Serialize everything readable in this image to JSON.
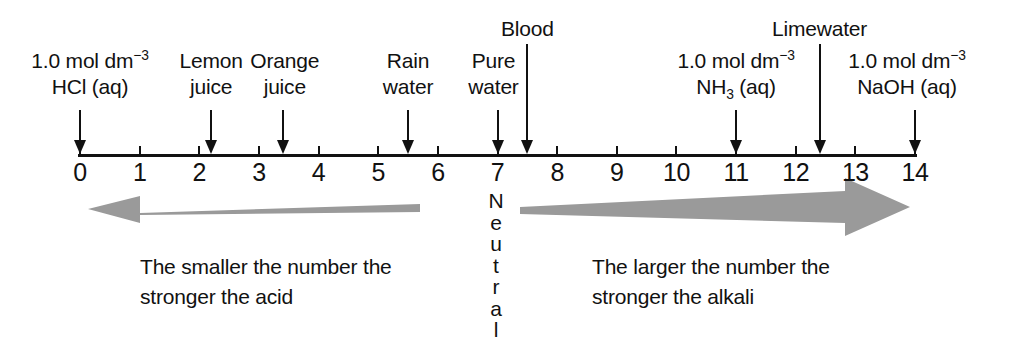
{
  "figure": {
    "type": "ph-scale-diagram",
    "background": "#ffffff",
    "ink_color": "#111111",
    "arrow_gray": "#9a9a9a"
  },
  "axis": {
    "min": 0,
    "max": 14,
    "ticks": [
      "0",
      "1",
      "2",
      "3",
      "4",
      "5",
      "6",
      "7",
      "8",
      "9",
      "10",
      "11",
      "12",
      "13",
      "14"
    ],
    "tick_values": [
      0,
      1,
      2,
      3,
      4,
      5,
      6,
      7,
      8,
      9,
      10,
      11,
      12,
      13,
      14
    ]
  },
  "neutral_marker": {
    "word": "Neutral",
    "ph": 7,
    "letters": [
      "N",
      "e",
      "u",
      "t",
      "r",
      "a",
      "l"
    ]
  },
  "substances": [
    {
      "id": "hcl",
      "ph": 0.0,
      "line1_html": "1.0 mol dm<sup>−3</sup>",
      "line2_html": "HCl (aq)",
      "lines": 2,
      "plain": "1.0 mol dm-3 HCl (aq)"
    },
    {
      "id": "lemon-juice",
      "ph": 2.2,
      "line1_html": "Lemon",
      "line2_html": "juice",
      "lines": 2,
      "plain": "Lemon juice"
    },
    {
      "id": "orange-juice",
      "ph": 3.4,
      "line1_html": "Orange",
      "line2_html": "juice",
      "lines": 2,
      "plain": "Orange juice"
    },
    {
      "id": "rain-water",
      "ph": 5.5,
      "line1_html": "Rain",
      "line2_html": "water",
      "lines": 2,
      "plain": "Rain water"
    },
    {
      "id": "pure-water",
      "ph": 7.0,
      "line1_html": "Pure",
      "line2_html": "water",
      "lines": 2,
      "plain": "Pure water"
    },
    {
      "id": "blood",
      "ph": 7.5,
      "line1_html": "Blood",
      "line2_html": "",
      "lines": 1,
      "plain": "Blood"
    },
    {
      "id": "ammonia",
      "ph": 11.0,
      "line1_html": "1.0 mol dm<sup>−3</sup>",
      "line2_html": "NH<sub>3</sub> (aq)",
      "lines": 2,
      "plain": "1.0 mol dm-3 NH3 (aq)"
    },
    {
      "id": "limewater",
      "ph": 12.4,
      "line1_html": "Limewater",
      "line2_html": "",
      "lines": 1,
      "plain": "Limewater"
    },
    {
      "id": "naoh",
      "ph": 14.0,
      "line1_html": "1.0 mol dm<sup>−3</sup>",
      "line2_html": "NaOH (aq)",
      "lines": 2,
      "plain": "1.0 mol dm-3 NaOH (aq)"
    }
  ],
  "acid_side": {
    "direction": "left",
    "from_ph": 6.5,
    "to_ph": 0,
    "caption_line1": "The smaller the number the",
    "caption_line2": "stronger the acid"
  },
  "alkali_side": {
    "direction": "right",
    "from_ph": 7.5,
    "to_ph": 14,
    "caption_line1": "The larger the number the",
    "caption_line2": "stronger the alkali"
  }
}
